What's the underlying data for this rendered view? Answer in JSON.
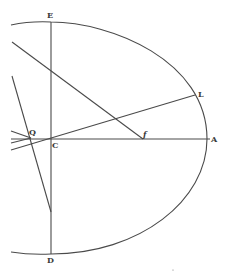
{
  "diagram": {
    "type": "geometric-figure",
    "colors": {
      "ink": "#4a4a4a",
      "background": "#ffffff"
    },
    "labels": {
      "E": "E",
      "L": "L",
      "Q": "Q",
      "C": "C",
      "f": "f",
      "A": "A",
      "D": "D"
    },
    "points": {
      "E": [
        51,
        22
      ],
      "C": [
        51,
        139
      ],
      "A": [
        207,
        139
      ],
      "D": [
        51,
        254
      ],
      "L": [
        195,
        95
      ],
      "f": [
        143,
        139
      ],
      "Q": [
        30,
        137
      ]
    }
  }
}
